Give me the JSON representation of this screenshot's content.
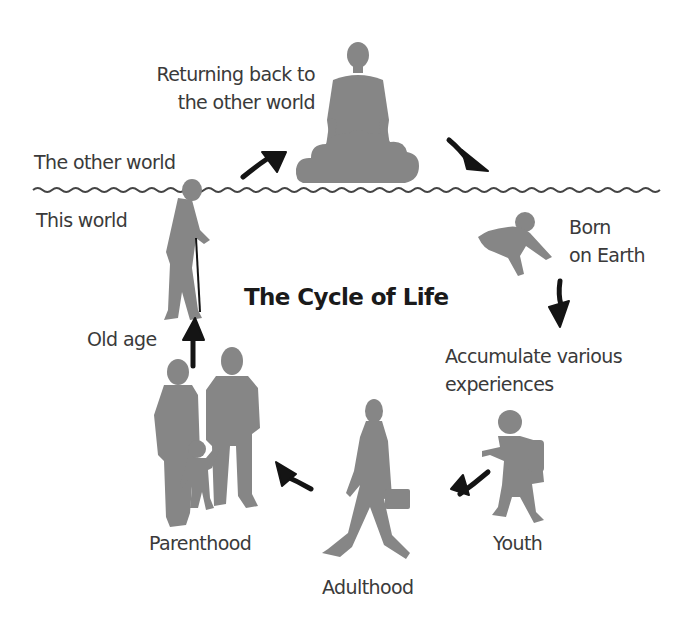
{
  "diagram": {
    "title": "The Cycle of Life",
    "realms": {
      "upper": "The other world",
      "lower": "This world"
    },
    "stages": [
      {
        "id": "return",
        "label_lines": [
          "Returning back to",
          "the other world"
        ],
        "figure": "person-on-cloud"
      },
      {
        "id": "born",
        "label_lines": [
          "Born",
          "on Earth"
        ],
        "figure": "crawling-baby"
      },
      {
        "id": "accumulate",
        "label_lines": [
          "Accumulate various",
          "experiences"
        ],
        "figure": "none"
      },
      {
        "id": "youth",
        "label_lines": [
          "Youth"
        ],
        "figure": "walking-child-with-backpack"
      },
      {
        "id": "adulthood",
        "label_lines": [
          "Adulthood"
        ],
        "figure": "walking-man-with-briefcase"
      },
      {
        "id": "parenthood",
        "label_lines": [
          "Parenthood"
        ],
        "figure": "family-couple-with-child"
      },
      {
        "id": "oldage",
        "label_lines": [
          "Old age"
        ],
        "figure": "elderly-man-with-cane"
      }
    ],
    "flow_order": [
      "Old age",
      "Returning back to the other world",
      "Born on Earth",
      "Accumulate various experiences",
      "Youth",
      "Adulthood",
      "Parenthood",
      "Old age"
    ],
    "colors": {
      "figure": "#868686",
      "arrow": "#141414",
      "text": "#3a3a3a",
      "title": "#1a1a1a",
      "divider": "#444444",
      "background": "#ffffff"
    }
  }
}
